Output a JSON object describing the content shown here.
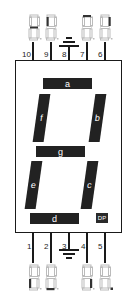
{
  "diagram": {
    "segment_color": "#222222",
    "outline_color": "#1a1a1a",
    "segments": [
      {
        "id": "a",
        "label": "a"
      },
      {
        "id": "b",
        "label": "b"
      },
      {
        "id": "c",
        "label": "c"
      },
      {
        "id": "d",
        "label": "d"
      },
      {
        "id": "e",
        "label": "e"
      },
      {
        "id": "f",
        "label": "f"
      },
      {
        "id": "g",
        "label": "g"
      },
      {
        "id": "dp",
        "label": "DP"
      }
    ],
    "top_pins": [
      {
        "number": "10",
        "function": "g"
      },
      {
        "number": "9",
        "function": "f"
      },
      {
        "number": "8",
        "function": "common-ground"
      },
      {
        "number": "7",
        "function": "a"
      },
      {
        "number": "6",
        "function": "b"
      }
    ],
    "bottom_pins": [
      {
        "number": "1",
        "function": "e"
      },
      {
        "number": "2",
        "function": "d"
      },
      {
        "number": "3",
        "function": "common-ground"
      },
      {
        "number": "4",
        "function": "c"
      },
      {
        "number": "5",
        "function": "dp"
      }
    ]
  }
}
